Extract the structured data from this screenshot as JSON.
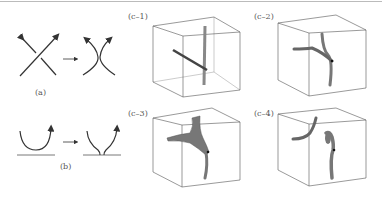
{
  "figure": {
    "panels": [
      {
        "id": "a",
        "label": "(a)",
        "description": "crossing to smoothing reconnection"
      },
      {
        "id": "b",
        "label": "(b)",
        "description": "loop touching wall reconnection"
      },
      {
        "id": "c1",
        "label": "(c–1)"
      },
      {
        "id": "c2",
        "label": "(c–2)"
      },
      {
        "id": "c3",
        "label": "(c–3)"
      },
      {
        "id": "c4",
        "label": "(c–4)"
      }
    ],
    "colors": {
      "line": "#333333",
      "tube": "#666666",
      "box": "#555555",
      "rule": "#bbbbbb"
    }
  }
}
